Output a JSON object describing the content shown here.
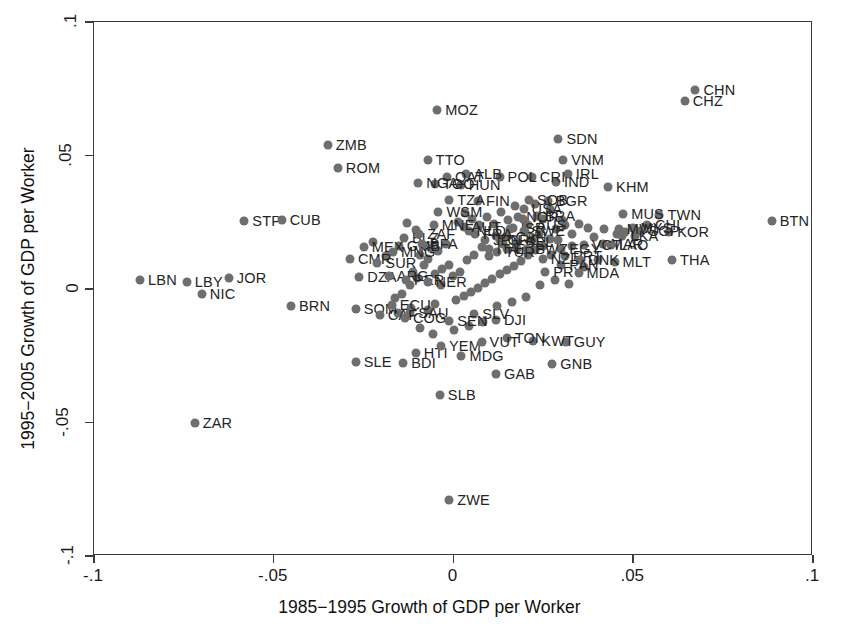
{
  "chart_data": {
    "type": "scatter",
    "title": "",
    "xlabel": "1985−1995 Growth of GDP per Worker",
    "ylabel": "1995−2005 Growth of GDP per Worker",
    "xlim": [
      -0.1,
      0.1
    ],
    "ylim": [
      -0.1,
      0.1
    ],
    "xticks": [
      -0.1,
      -0.05,
      0,
      0.05,
      0.1
    ],
    "yticks": [
      -0.1,
      -0.05,
      0,
      0.05,
      0.1
    ],
    "xticklabels": [
      "-.1",
      "-.05",
      "0",
      ".05",
      ".1"
    ],
    "yticklabels": [
      "-.1",
      "-.05",
      "0",
      ".05",
      ".1"
    ],
    "grid": false,
    "legend": null,
    "marker_color": "#6e6e6e",
    "frame_color": "#3b3b3b",
    "point_label_field": "label",
    "points": [
      {
        "label": "BTN",
        "x": 0.0885,
        "y": 0.0253,
        "lp": "right"
      },
      {
        "label": "CHN",
        "x": 0.0673,
        "y": 0.0745,
        "lp": "right"
      },
      {
        "label": "CHZ",
        "x": 0.0643,
        "y": 0.0705,
        "lp": "right"
      },
      {
        "label": "TWN",
        "x": 0.0573,
        "y": 0.0278,
        "lp": "right"
      },
      {
        "label": "MUS",
        "x": 0.0472,
        "y": 0.028,
        "lp": "right"
      },
      {
        "label": "KHM",
        "x": 0.043,
        "y": 0.0383,
        "lp": "right"
      },
      {
        "label": "THA",
        "x": 0.0608,
        "y": 0.0108,
        "lp": "right"
      },
      {
        "label": "KOR",
        "x": 0.06,
        "y": 0.0213,
        "lp": "right"
      },
      {
        "label": "CHL",
        "x": 0.0538,
        "y": 0.024,
        "lp": "right"
      },
      {
        "label": "MYS",
        "x": 0.0498,
        "y": 0.023,
        "lp": "right"
      },
      {
        "label": "SGP",
        "x": 0.052,
        "y": 0.0216,
        "lp": "right"
      },
      {
        "label": "MWI",
        "x": 0.046,
        "y": 0.0225,
        "lp": "right"
      },
      {
        "label": "LKA",
        "x": 0.047,
        "y": 0.02,
        "lp": "right"
      },
      {
        "label": "MLT",
        "x": 0.0448,
        "y": 0.01,
        "lp": "right"
      },
      {
        "label": "MAR",
        "x": 0.0415,
        "y": 0.017,
        "lp": "right"
      },
      {
        "label": "LAO",
        "x": 0.0438,
        "y": 0.0165,
        "lp": "right"
      },
      {
        "label": "VCT",
        "x": 0.0362,
        "y": 0.0163,
        "lp": "right"
      },
      {
        "label": "EGY",
        "x": 0.03,
        "y": 0.015,
        "lp": "right"
      },
      {
        "label": "PRT",
        "x": 0.031,
        "y": 0.0122,
        "lp": "right"
      },
      {
        "label": "DNK",
        "x": 0.0352,
        "y": 0.0108,
        "lp": "right"
      },
      {
        "label": "PAN",
        "x": 0.03,
        "y": 0.009,
        "lp": "right"
      },
      {
        "label": "NZL",
        "x": 0.0248,
        "y": 0.0112,
        "lp": "right"
      },
      {
        "label": "SDN",
        "x": 0.0292,
        "y": 0.0563,
        "lp": "right"
      },
      {
        "label": "VNM",
        "x": 0.0305,
        "y": 0.0483,
        "lp": "right"
      },
      {
        "label": "IRL",
        "x": 0.0318,
        "y": 0.043,
        "lp": "right"
      },
      {
        "label": "IND",
        "x": 0.0285,
        "y": 0.04,
        "lp": "right"
      },
      {
        "label": "CRI",
        "x": 0.0218,
        "y": 0.0418,
        "lp": "right"
      },
      {
        "label": "BGR",
        "x": 0.0262,
        "y": 0.033,
        "lp": "right"
      },
      {
        "label": "SOB",
        "x": 0.021,
        "y": 0.0335,
        "lp": "right"
      },
      {
        "label": "USA",
        "x": 0.0195,
        "y": 0.0298,
        "lp": "right"
      },
      {
        "label": "BRA",
        "x": 0.0232,
        "y": 0.0272,
        "lp": "right"
      },
      {
        "label": "NOR",
        "x": 0.018,
        "y": 0.0268,
        "lp": "right"
      },
      {
        "label": "AUS",
        "x": 0.0208,
        "y": 0.024,
        "lp": "right"
      },
      {
        "label": "ISR",
        "x": 0.0165,
        "y": 0.023,
        "lp": "right"
      },
      {
        "label": "SWE",
        "x": 0.0195,
        "y": 0.0218,
        "lp": "right"
      },
      {
        "label": "CAN",
        "x": 0.015,
        "y": 0.0195,
        "lp": "right"
      },
      {
        "label": "BEL",
        "x": 0.0178,
        "y": 0.0175,
        "lp": "right"
      },
      {
        "label": "GRC",
        "x": 0.0128,
        "y": 0.0182,
        "lp": "right"
      },
      {
        "label": "ESP",
        "x": 0.015,
        "y": 0.015,
        "lp": "right"
      },
      {
        "label": "SWZ",
        "x": 0.0205,
        "y": 0.015,
        "lp": "right"
      },
      {
        "label": "TUR",
        "x": 0.012,
        "y": 0.014,
        "lp": "right"
      },
      {
        "label": "ITA",
        "x": 0.0098,
        "y": 0.015,
        "lp": "right"
      },
      {
        "label": "JPN",
        "x": 0.0088,
        "y": 0.0185,
        "lp": "right"
      },
      {
        "label": "FRA",
        "x": 0.006,
        "y": 0.0205,
        "lp": "right"
      },
      {
        "label": "NLD",
        "x": 0.0042,
        "y": 0.0218,
        "lp": "right"
      },
      {
        "label": "AUT",
        "x": 0.0028,
        "y": 0.0232,
        "lp": "right"
      },
      {
        "label": "FIN",
        "x": 0.0068,
        "y": 0.033,
        "lp": "right"
      },
      {
        "label": "TZA",
        "x": -0.0012,
        "y": 0.0335,
        "lp": "right"
      },
      {
        "label": "HUN",
        "x": 0.002,
        "y": 0.039,
        "lp": "right"
      },
      {
        "label": "POL",
        "x": 0.0128,
        "y": 0.042,
        "lp": "right"
      },
      {
        "label": "ALB",
        "x": 0.0035,
        "y": 0.0432,
        "lp": "right"
      },
      {
        "label": "QAT",
        "x": -0.0018,
        "y": 0.042,
        "lp": "right"
      },
      {
        "label": "TGO",
        "x": -0.0052,
        "y": 0.0392,
        "lp": "right"
      },
      {
        "label": "NGA",
        "x": -0.0098,
        "y": 0.0398,
        "lp": "right"
      },
      {
        "label": "TTO",
        "x": -0.0072,
        "y": 0.0485,
        "lp": "right"
      },
      {
        "label": "MOZ",
        "x": -0.0045,
        "y": 0.0672,
        "lp": "right"
      },
      {
        "label": "ZMB",
        "x": -0.035,
        "y": 0.054,
        "lp": "right"
      },
      {
        "label": "ROM",
        "x": -0.0322,
        "y": 0.0455,
        "lp": "right"
      },
      {
        "label": "WSM",
        "x": -0.0042,
        "y": 0.029,
        "lp": "right"
      },
      {
        "label": "MNE",
        "x": -0.0055,
        "y": 0.024,
        "lp": "right"
      },
      {
        "label": "BLZ",
        "x": -0.0138,
        "y": 0.0192,
        "lp": "right"
      },
      {
        "label": "ZAF",
        "x": -0.0095,
        "y": 0.0205,
        "lp": "right"
      },
      {
        "label": "GMB",
        "x": -0.0152,
        "y": 0.0162,
        "lp": "right"
      },
      {
        "label": "BFA",
        "x": -0.0088,
        "y": 0.0168,
        "lp": "right"
      },
      {
        "label": "STP",
        "x": -0.0582,
        "y": 0.0255,
        "lp": "right"
      },
      {
        "label": "CUB",
        "x": -0.0478,
        "y": 0.0258,
        "lp": "right"
      },
      {
        "label": "MEX",
        "x": -0.025,
        "y": 0.0158,
        "lp": "right"
      },
      {
        "label": "MNG",
        "x": -0.0168,
        "y": 0.014,
        "lp": "right"
      },
      {
        "label": "CMR",
        "x": -0.0288,
        "y": 0.0112,
        "lp": "right"
      },
      {
        "label": "SUR",
        "x": -0.0212,
        "y": 0.0098,
        "lp": "right"
      },
      {
        "label": "DZA",
        "x": -0.0262,
        "y": 0.0045,
        "lp": "right"
      },
      {
        "label": "ARG",
        "x": -0.018,
        "y": 0.0048,
        "lp": "right"
      },
      {
        "label": "PER",
        "x": -0.0132,
        "y": 0.0035,
        "lp": "right"
      },
      {
        "label": "NER",
        "x": -0.0072,
        "y": 0.0028,
        "lp": "right"
      },
      {
        "label": "LBN",
        "x": -0.0872,
        "y": 0.0032,
        "lp": "right"
      },
      {
        "label": "LBY",
        "x": -0.0742,
        "y": 0.0025,
        "lp": "right"
      },
      {
        "label": "NIC",
        "x": -0.07,
        "y": -0.002,
        "lp": "right"
      },
      {
        "label": "JOR",
        "x": -0.0625,
        "y": 0.0042,
        "lp": "right"
      },
      {
        "label": "BRN",
        "x": -0.0452,
        "y": -0.0065,
        "lp": "right"
      },
      {
        "label": "SOM",
        "x": -0.0272,
        "y": -0.0075,
        "lp": "right"
      },
      {
        "label": "ECU",
        "x": -0.0172,
        "y": -0.006,
        "lp": "right"
      },
      {
        "label": "SAU",
        "x": -0.012,
        "y": -0.009,
        "lp": "right"
      },
      {
        "label": "CAF",
        "x": -0.0205,
        "y": -0.0098,
        "lp": "right"
      },
      {
        "label": "COG",
        "x": -0.0135,
        "y": -0.0108,
        "lp": "right"
      },
      {
        "label": "SLE",
        "x": -0.0272,
        "y": -0.0272,
        "lp": "right"
      },
      {
        "label": "BDI",
        "x": -0.014,
        "y": -0.0278,
        "lp": "right"
      },
      {
        "label": "HTI",
        "x": -0.0105,
        "y": -0.0238,
        "lp": "right"
      },
      {
        "label": "YEM",
        "x": -0.0035,
        "y": -0.0215,
        "lp": "right"
      },
      {
        "label": "MDG",
        "x": 0.0022,
        "y": -0.0252,
        "lp": "right"
      },
      {
        "label": "SLB",
        "x": -0.0038,
        "y": -0.0398,
        "lp": "right"
      },
      {
        "label": "GAB",
        "x": 0.0118,
        "y": -0.0318,
        "lp": "right"
      },
      {
        "label": "GNB",
        "x": 0.0275,
        "y": -0.0282,
        "lp": "right"
      },
      {
        "label": "GUY",
        "x": 0.0312,
        "y": -0.0198,
        "lp": "right"
      },
      {
        "label": "KWT",
        "x": 0.0222,
        "y": -0.0195,
        "lp": "right"
      },
      {
        "label": "TON",
        "x": 0.0148,
        "y": -0.0185,
        "lp": "right"
      },
      {
        "label": "VUT",
        "x": 0.0078,
        "y": -0.0198,
        "lp": "right"
      },
      {
        "label": "DJI",
        "x": 0.0118,
        "y": -0.0115,
        "lp": "right"
      },
      {
        "label": "SLV",
        "x": 0.0058,
        "y": -0.0092,
        "lp": "right"
      },
      {
        "label": "SEN",
        "x": -0.0012,
        "y": -0.0118,
        "lp": "right"
      },
      {
        "label": "PRY",
        "x": 0.0255,
        "y": 0.0062,
        "lp": "right"
      },
      {
        "label": "MDA",
        "x": 0.0348,
        "y": 0.006,
        "lp": "right"
      },
      {
        "label": "ZAR",
        "x": -0.072,
        "y": -0.05,
        "lp": "right"
      },
      {
        "label": "ZWE",
        "x": -0.0012,
        "y": -0.0792,
        "lp": "right"
      }
    ],
    "extra_markers": [
      {
        "x": 0.042,
        "y": 0.0225
      },
      {
        "x": 0.0455,
        "y": 0.0205
      },
      {
        "x": 0.0478,
        "y": 0.0215
      },
      {
        "x": 0.0505,
        "y": 0.0198
      },
      {
        "x": 0.0392,
        "y": 0.0195
      },
      {
        "x": 0.0375,
        "y": 0.0228
      },
      {
        "x": 0.0348,
        "y": 0.0245
      },
      {
        "x": 0.033,
        "y": 0.0205
      },
      {
        "x": 0.0302,
        "y": 0.0258
      },
      {
        "x": 0.0285,
        "y": 0.0225
      },
      {
        "x": 0.0268,
        "y": 0.0188
      },
      {
        "x": 0.0248,
        "y": 0.0162
      },
      {
        "x": 0.0228,
        "y": 0.0145
      },
      {
        "x": 0.0208,
        "y": 0.0128
      },
      {
        "x": 0.0188,
        "y": 0.0105
      },
      {
        "x": 0.0168,
        "y": 0.0088
      },
      {
        "x": 0.0148,
        "y": 0.0072
      },
      {
        "x": 0.0128,
        "y": 0.0055
      },
      {
        "x": 0.0108,
        "y": 0.0038
      },
      {
        "x": 0.0088,
        "y": 0.0022
      },
      {
        "x": 0.0068,
        "y": 0.0005
      },
      {
        "x": 0.0048,
        "y": -0.0012
      },
      {
        "x": 0.0028,
        "y": -0.0028
      },
      {
        "x": 0.0008,
        "y": -0.0042
      },
      {
        "x": -0.0012,
        "y": 0.009
      },
      {
        "x": -0.0032,
        "y": 0.0075
      },
      {
        "x": -0.0052,
        "y": 0.0058
      },
      {
        "x": -0.0072,
        "y": 0.0112
      },
      {
        "x": -0.0092,
        "y": 0.0128
      },
      {
        "x": -0.0112,
        "y": 0.0065
      },
      {
        "x": 0.0012,
        "y": 0.025
      },
      {
        "x": 0.0032,
        "y": 0.0285
      },
      {
        "x": 0.0052,
        "y": 0.0262
      },
      {
        "x": 0.0072,
        "y": 0.024
      },
      {
        "x": 0.0092,
        "y": 0.0268
      },
      {
        "x": 0.0112,
        "y": 0.0245
      },
      {
        "x": 0.0132,
        "y": 0.0288
      },
      {
        "x": 0.0152,
        "y": 0.0258
      },
      {
        "x": 0.0172,
        "y": 0.0312
      },
      {
        "x": 0.0192,
        "y": 0.0262
      },
      {
        "x": -0.0022,
        "y": 0.0168
      },
      {
        "x": -0.0042,
        "y": 0.0142
      },
      {
        "x": -0.0062,
        "y": 0.0155
      },
      {
        "x": -0.0082,
        "y": 0.009
      },
      {
        "x": -0.0102,
        "y": 0.004
      },
      {
        "x": -0.0122,
        "y": 0.0015
      },
      {
        "x": -0.0142,
        "y": -0.002
      },
      {
        "x": -0.0162,
        "y": -0.0035
      },
      {
        "x": -0.0052,
        "y": -0.0058
      },
      {
        "x": -0.0072,
        "y": -0.0078
      },
      {
        "x": -0.0092,
        "y": -0.0145
      },
      {
        "x": -0.0058,
        "y": -0.0168
      },
      {
        "x": 0.0002,
        "y": -0.0152
      },
      {
        "x": 0.0042,
        "y": -0.0138
      },
      {
        "x": 0.0082,
        "y": -0.0125
      },
      {
        "x": 0.0122,
        "y": -0.0062
      },
      {
        "x": 0.0162,
        "y": -0.0048
      },
      {
        "x": 0.0202,
        "y": -0.003
      },
      {
        "x": 0.0242,
        "y": 0.0015
      },
      {
        "x": 0.0282,
        "y": 0.0035
      },
      {
        "x": 0.0322,
        "y": 0.0018
      },
      {
        "x": 0.0362,
        "y": 0.0082
      },
      {
        "x": 0.0402,
        "y": 0.0108
      },
      {
        "x": 0.0238,
        "y": 0.0205
      },
      {
        "x": 0.0218,
        "y": 0.0182
      },
      {
        "x": 0.0198,
        "y": 0.0212
      },
      {
        "x": 0.0178,
        "y": 0.0148
      },
      {
        "x": 0.0158,
        "y": 0.0225
      },
      {
        "x": 0.0138,
        "y": 0.0168
      },
      {
        "x": 0.0118,
        "y": 0.0198
      },
      {
        "x": 0.0098,
        "y": 0.0122
      },
      {
        "x": 0.0078,
        "y": 0.0158
      },
      {
        "x": 0.0058,
        "y": 0.0128
      },
      {
        "x": 0.0038,
        "y": 0.0108
      },
      {
        "x": 0.0018,
        "y": 0.0065
      },
      {
        "x": -0.0002,
        "y": 0.0048
      },
      {
        "x": -0.0035,
        "y": 0.0015
      },
      {
        "x": -0.0118,
        "y": -0.0072
      },
      {
        "x": -0.0155,
        "y": -0.009
      },
      {
        "x": -0.0188,
        "y": 0.0125
      },
      {
        "x": -0.0225,
        "y": 0.0175
      },
      {
        "x": -0.0105,
        "y": 0.022
      },
      {
        "x": -0.0128,
        "y": 0.0248
      },
      {
        "x": 0.0268,
        "y": 0.03
      },
      {
        "x": 0.0248,
        "y": 0.0262
      },
      {
        "x": 0.0228,
        "y": 0.0318
      },
      {
        "x": 0.031,
        "y": 0.0238
      },
      {
        "x": 0.033,
        "y": 0.0162
      },
      {
        "x": 0.0272,
        "y": 0.0128
      },
      {
        "x": 0.0292,
        "y": 0.0182
      }
    ]
  }
}
